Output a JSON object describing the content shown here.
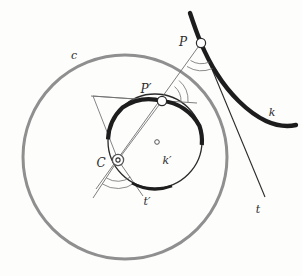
{
  "figure": {
    "background_color": "#fdfdfc"
  },
  "colors": {
    "circle_c_stroke": "#8f8f8f",
    "curve_thick_stroke": "#1d1d1d",
    "thin_line_stroke": "#6f6f6f",
    "inner_circle_stroke": "#2a2a2a",
    "label_fill": "#2b2b2b",
    "marker_fill": "#ffffff"
  },
  "labels": {
    "c": "c",
    "k": "k",
    "k_prime": "k′",
    "t": "t",
    "t_prime": "t′",
    "P": "P",
    "P_prime": "P′",
    "C": "C"
  },
  "geometry": {
    "circle_c": {
      "cx": 125,
      "cy": 157,
      "r": 102,
      "stroke_width": 3
    },
    "circle_k_prime": {
      "cx": 155,
      "cy": 141,
      "r": 47,
      "stroke_width": 1.4
    },
    "point_P": {
      "x": 201,
      "y": 43,
      "marker_r": 4.5
    },
    "point_P_prime": {
      "x": 162,
      "y": 101,
      "marker_r": 4.5
    },
    "point_C": {
      "x": 118,
      "y": 160,
      "marker_outer_r": 5.5,
      "marker_inner_r": 2
    },
    "point_k_prime_center": {
      "x": 157,
      "y": 142,
      "marker_r": 2.2
    },
    "ray_C_to_P": {
      "x1": 96,
      "y1": 186,
      "x2": 201,
      "y2": 43
    },
    "tangent_t": {
      "x1": 190,
      "y1": 14,
      "x2": 265,
      "y2": 197
    },
    "tangent_t_prime": {
      "x1": 91,
      "y1": 96,
      "x2": 197,
      "y2": 103
    },
    "triangle": [
      {
        "x": 93,
        "y": 96
      },
      {
        "x": 162,
        "y": 101
      },
      {
        "x": 118,
        "y": 160
      }
    ],
    "angle_arcs_at_P": 2,
    "angle_arcs_at_P_prime": 2,
    "angle_arcs_at_C": 2
  },
  "label_positions": {
    "c": {
      "x": 74,
      "y": 59
    },
    "k": {
      "x": 272,
      "y": 116
    },
    "k_prime": {
      "x": 167,
      "y": 163
    },
    "t": {
      "x": 258,
      "y": 212
    },
    "t_prime": {
      "x": 146,
      "y": 204
    },
    "P": {
      "x": 182,
      "y": 45
    },
    "P_prime": {
      "x": 144,
      "y": 92
    },
    "C": {
      "x": 100,
      "y": 166
    }
  },
  "curve_k": {
    "description": "thick dark curve from upper area sweeping down-right and flattening",
    "path": "M 190,13 C 196,30 204,52 218,74 C 230,93 248,113 268,122 C 278,126 287,127 295,126"
  },
  "arc_k_prime_thick": {
    "description": "thick dark arc of inner circle from left side counterclockwise through top to right side",
    "start_angle_deg": 182,
    "end_angle_deg": 5
  }
}
